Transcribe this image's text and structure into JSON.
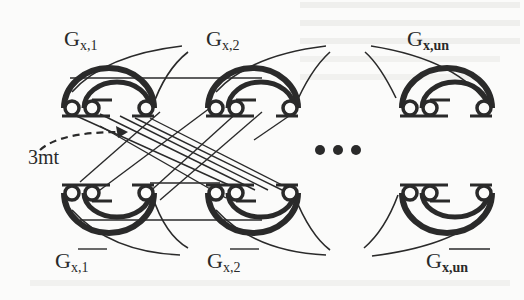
{
  "diagram": {
    "top_gadgets": [
      {
        "id": "g-x-1",
        "base": "G",
        "sub": "x,1",
        "overline": false
      },
      {
        "id": "g-x-2",
        "base": "G",
        "sub": "x,2",
        "overline": false
      },
      {
        "id": "g-x-un",
        "base": "G",
        "sub": "x,un",
        "overline": false
      }
    ],
    "bottom_gadgets": [
      {
        "id": "g-x-1-bar",
        "base": "G",
        "sub": "x,1",
        "overline": true
      },
      {
        "id": "g-x-2-bar",
        "base": "G",
        "sub": "x,2",
        "overline": true
      },
      {
        "id": "g-x-un-bar",
        "base": "G",
        "sub": "x,un",
        "overline": true
      }
    ],
    "annotation": {
      "text": "3mt",
      "points_to": "bundle of crossing edges"
    },
    "ellipsis": "• • •",
    "colors": {
      "ink": "#2a2a2a",
      "background": "#fbfbfa",
      "bleed_text": "#ededeb"
    }
  }
}
